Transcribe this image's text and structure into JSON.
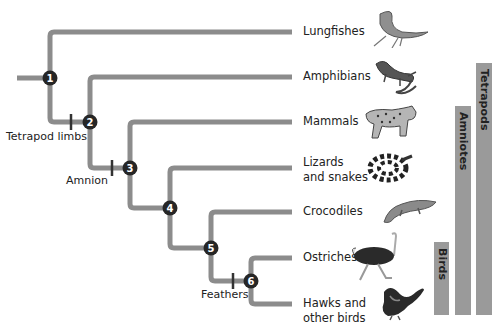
{
  "diagram": {
    "type": "cladogram",
    "line_color": "#8c8c8c",
    "node_color": "#262626",
    "bar_color": "#9a9a9a",
    "taxa": [
      {
        "label": "Lungfishes"
      },
      {
        "label": "Amphibians"
      },
      {
        "label": "Mammals"
      },
      {
        "label": "Lizards\nand snakes",
        "line1": "Lizards",
        "line2": "and snakes"
      },
      {
        "label": "Crocodiles"
      },
      {
        "label": "Ostriches"
      },
      {
        "label": "Hawks and\nother birds",
        "line1": "Hawks and",
        "line2": "other birds"
      }
    ],
    "nodes": [
      "1",
      "2",
      "3",
      "4",
      "5",
      "6"
    ],
    "derived_traits": [
      {
        "label": "Tetrapod limbs",
        "between_nodes": [
          "1",
          "2"
        ]
      },
      {
        "label": "Amnion",
        "between_nodes": [
          "2",
          "3"
        ]
      },
      {
        "label": "Feathers",
        "between_nodes": [
          "5",
          "6"
        ]
      }
    ],
    "clade_bars": [
      {
        "label": "Birds"
      },
      {
        "label": "Amniotes"
      },
      {
        "label": "Tetrapods"
      }
    ],
    "animal_icons": [
      "lungfish-icon",
      "salamander-icon",
      "bobcat-icon",
      "snake-icon",
      "crocodile-icon",
      "ostrich-icon",
      "hawk-icon"
    ]
  }
}
